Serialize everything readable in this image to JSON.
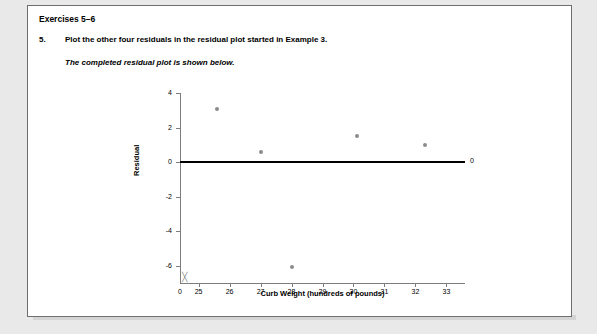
{
  "header": {
    "title": "Exercises 5–6"
  },
  "question": {
    "number": "5.",
    "text": "Plot the other four residuals in the residual plot started in Example 3.",
    "subtext": "The completed residual plot is shown below."
  },
  "chart_data": {
    "type": "scatter",
    "title": "",
    "xlabel": "Curb Weight (hundreds of pounds)",
    "ylabel": "Residual",
    "xlim": [
      24.4,
      33.6
    ],
    "ylim": [
      -7,
      4
    ],
    "xticks": [
      25,
      26,
      27,
      28,
      29,
      30,
      31,
      32,
      33
    ],
    "yticks": [
      4,
      2,
      0,
      -2,
      -4,
      -6
    ],
    "xtick_labels": [
      "25",
      "26",
      "27",
      "28",
      "29",
      "30",
      "31",
      "32",
      "33"
    ],
    "ytick_labels": [
      "4",
      "2",
      "0",
      "-2",
      "-4",
      "-6"
    ],
    "origin_label": "0",
    "axis_break": true,
    "grid": false,
    "legend": false,
    "reference_line": {
      "y": 0,
      "label": "0",
      "color": "#000000"
    },
    "points": [
      {
        "x": 25.6,
        "y": 3.1
      },
      {
        "x": 27.0,
        "y": 0.6
      },
      {
        "x": 28.0,
        "y": -6.1
      },
      {
        "x": 30.1,
        "y": 1.5
      },
      {
        "x": 32.3,
        "y": 1.0
      }
    ],
    "point_color": "#8c8c8c"
  }
}
